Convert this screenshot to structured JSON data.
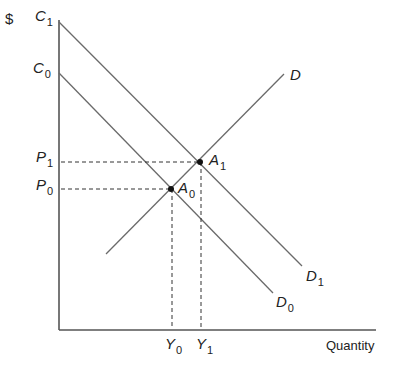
{
  "diagram": {
    "y_axis_label": "$",
    "x_axis_label": "Quantity",
    "intercepts": {
      "c1": {
        "base": "C",
        "sub": "1"
      },
      "c0": {
        "base": "C",
        "sub": "0"
      }
    },
    "prices": {
      "p1": {
        "base": "P",
        "sub": "1"
      },
      "p0": {
        "base": "P",
        "sub": "0"
      }
    },
    "quantities": {
      "y0": {
        "base": "Y",
        "sub": "0"
      },
      "y1": {
        "base": "Y",
        "sub": "1"
      }
    },
    "points": {
      "a1": {
        "base": "A",
        "sub": "1"
      },
      "a0": {
        "base": "A",
        "sub": "0"
      }
    },
    "curves": {
      "d": {
        "base": "D",
        "sub": ""
      },
      "d1": {
        "base": "D",
        "sub": "1"
      },
      "d0": {
        "base": "D",
        "sub": "0"
      }
    },
    "colors": {
      "line": "#6a6a6a",
      "axis": "#555555",
      "dot": "#111111"
    }
  }
}
